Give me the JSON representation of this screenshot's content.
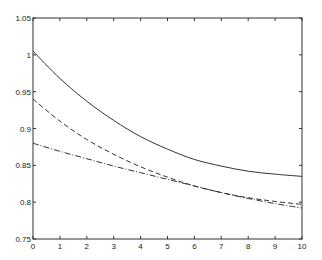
{
  "chart_data": {
    "type": "line",
    "title": "",
    "xlabel": "",
    "ylabel": "",
    "xlim": [
      0,
      10
    ],
    "ylim": [
      0.75,
      1.05
    ],
    "grid": false,
    "legend": null,
    "x_ticks": [
      "0",
      "1",
      "2",
      "3",
      "4",
      "5",
      "6",
      "7",
      "8",
      "9",
      "10"
    ],
    "y_ticks": [
      "0.75",
      "0.8",
      "0.85",
      "0.9",
      "0.95",
      "1",
      "1.05"
    ],
    "x": [
      0,
      1,
      2,
      3,
      4,
      5,
      6,
      7,
      8,
      9,
      10
    ],
    "series": [
      {
        "name": "solid",
        "style": "solid",
        "values": [
          1.005,
          0.968,
          0.937,
          0.911,
          0.889,
          0.872,
          0.858,
          0.849,
          0.842,
          0.838,
          0.835
        ]
      },
      {
        "name": "dashed",
        "style": "dashed",
        "values": [
          0.94,
          0.91,
          0.885,
          0.865,
          0.848,
          0.834,
          0.822,
          0.813,
          0.806,
          0.801,
          0.797
        ]
      },
      {
        "name": "dash-dot",
        "style": "dashdot",
        "values": [
          0.88,
          0.869,
          0.859,
          0.849,
          0.84,
          0.831,
          0.822,
          0.813,
          0.805,
          0.798,
          0.792
        ]
      }
    ]
  }
}
